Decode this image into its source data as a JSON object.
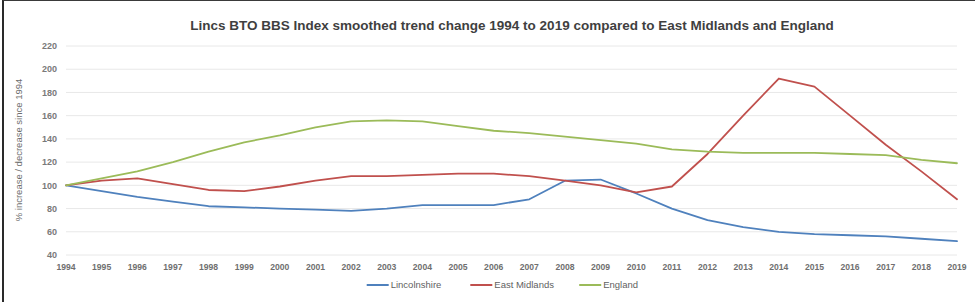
{
  "chart_data": {
    "type": "line",
    "title": "Lincs BTO BBS Index smoothed trend change 1994 to 2019 compared to East Midlands and England",
    "xlabel": "",
    "ylabel": "% increase / decrease since 1994",
    "ylim": [
      40,
      220
    ],
    "ytick_step": 20,
    "yticks": [
      220,
      200,
      180,
      160,
      140,
      120,
      100,
      80,
      60,
      40
    ],
    "grid": true,
    "legend_position": "bottom",
    "categories": [
      "1994",
      "1995",
      "1996",
      "1997",
      "1998",
      "1999",
      "2000",
      "2001",
      "2002",
      "2003",
      "2004",
      "2005",
      "2006",
      "2007",
      "2008",
      "2009",
      "2010",
      "2011",
      "2012",
      "2013",
      "2014",
      "2015",
      "2016",
      "2017",
      "2018",
      "2019"
    ],
    "series": [
      {
        "name": "Lincolnshire",
        "color": "#4F81BD",
        "values": [
          100,
          95,
          90,
          86,
          82,
          81,
          80,
          79,
          78,
          80,
          83,
          83,
          83,
          88,
          104,
          105,
          93,
          80,
          70,
          64,
          60,
          58,
          57,
          56,
          54,
          52
        ]
      },
      {
        "name": "East Midlands",
        "color": "#C0504D",
        "values": [
          100,
          104,
          106,
          101,
          96,
          95,
          99,
          104,
          108,
          108,
          109,
          110,
          110,
          108,
          104,
          100,
          94,
          99,
          127,
          160,
          192,
          185,
          160,
          135,
          112,
          88
        ]
      },
      {
        "name": "England",
        "color": "#9BBB59",
        "values": [
          100,
          106,
          112,
          120,
          129,
          137,
          143,
          150,
          155,
          156,
          155,
          151,
          147,
          145,
          142,
          139,
          136,
          131,
          129,
          128,
          128,
          128,
          127,
          126,
          122,
          119
        ]
      }
    ]
  },
  "legend": {
    "items": [
      {
        "label": "Lincolnshire",
        "color": "#4F81BD"
      },
      {
        "label": "East Midlands",
        "color": "#C0504D"
      },
      {
        "label": "England",
        "color": "#9BBB59"
      }
    ]
  }
}
